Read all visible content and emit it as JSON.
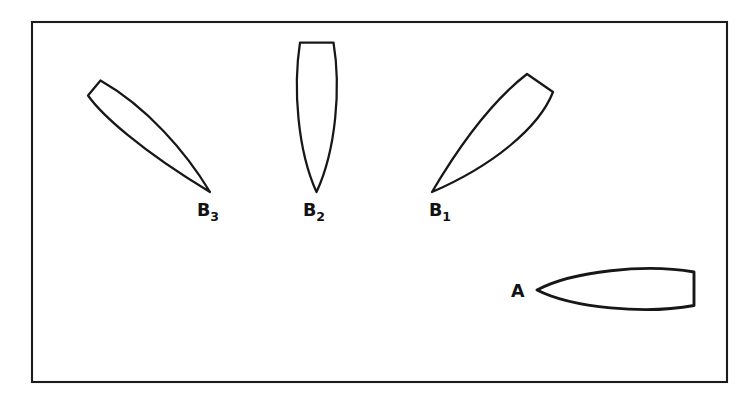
{
  "figure": {
    "background_color": "#ffffff",
    "ink_color": "#17171a",
    "frame": {
      "name": "figure-border-rectangle",
      "x": 32,
      "y": 22,
      "width": 695,
      "height": 360,
      "stroke_color": "#1c1c1c"
    },
    "shapes": [
      {
        "id": "B3",
        "label": "B",
        "subscript": "3",
        "description": "lens-shaped (leaf) outline tilted down-to-the-right, truncated flat edge at upper-left, sharp point at lower-right",
        "orientation_deg": 125,
        "label_x": 197,
        "label_y": 216,
        "path": "M 100.5 80.5 L 88.0 95.5 C 101.0 114.0 140.0 150.0 210.0 192.0 C 186.0 152.0 147.0 107.0 100.5 80.5 Z"
      },
      {
        "id": "B2",
        "label": "B",
        "subscript": "2",
        "description": "vertical lens-shaped (leaf) outline, flat truncated edge at top, sharp point at bottom",
        "orientation_deg": 90,
        "label_x": 303,
        "label_y": 216,
        "path": "M 300.0 42.5 L 333.5 42.5 C 341.0 88.0 336.0 150.0 316.5 192.0 C 297.5 150.0 293.0 88.0 300.0 42.5 Z"
      },
      {
        "id": "B1",
        "label": "B",
        "subscript": "1",
        "description": "lens-shaped (leaf) outline tilted down-to-the-left, truncated flat edge at upper-right, sharp point at lower-left",
        "orientation_deg": 55,
        "label_x": 429,
        "label_y": 216,
        "path": "M 527.0 74.0 L 553.0 92.0 C 539.0 128.0 492.0 166.0 432.0 192.0 C 455.0 153.0 487.0 105.0 527.0 74.0 Z"
      },
      {
        "id": "A",
        "label": "A",
        "subscript": "",
        "description": "horizontal lens-shaped (leaf) outline, sharp point at the left, flat truncated vertical edge at the right",
        "orientation_deg": 0,
        "label_x": 511,
        "label_y": 297,
        "path": "M 537.0 290.0 C 572.0 271.0 646.0 263.5 694.0 272.0 L 694.0 305.5 C 646.0 314.5 572.0 308.0 537.0 290.0 Z"
      }
    ]
  }
}
